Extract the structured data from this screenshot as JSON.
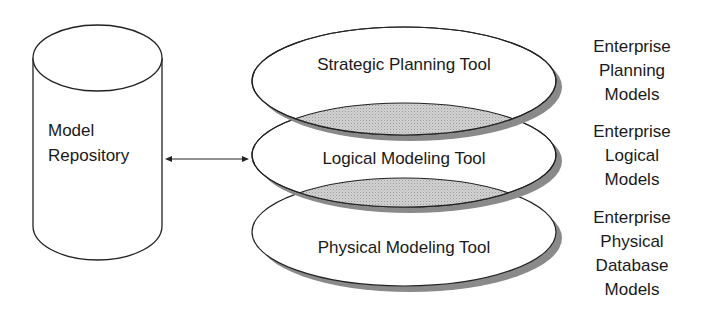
{
  "repository": {
    "label_line1": "Model",
    "label_line2": "Repository"
  },
  "connector": {
    "type": "bidirectional-arrow"
  },
  "tools": [
    {
      "label": "Strategic Planning Tool"
    },
    {
      "label": "Logical Modeling Tool"
    },
    {
      "label": "Physical Modeling Tool"
    }
  ],
  "models": [
    {
      "lines": [
        "Enterprise",
        "Planning",
        "Models"
      ]
    },
    {
      "lines": [
        "Enterprise",
        "Logical",
        "Models"
      ]
    },
    {
      "lines": [
        "Enterprise",
        "Physical",
        "Database",
        "Models"
      ]
    }
  ],
  "colors": {
    "stroke": "#222222",
    "shadow": "#8a8a8a",
    "overlap_fill": "#cfcfcf",
    "background": "#ffffff"
  }
}
